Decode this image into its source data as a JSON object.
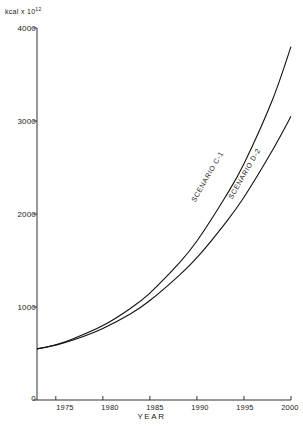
{
  "chart_data": {
    "type": "line",
    "title": "",
    "xlabel": "YEAR",
    "ylabel": "kcal x 10",
    "ylabel_exponent": "12",
    "xlim": [
      1973,
      2000
    ],
    "ylim": [
      0,
      4000
    ],
    "grid": false,
    "legend_position": "inline-curve-labels",
    "xticks": [
      1975,
      1980,
      1985,
      1990,
      1995,
      2000
    ],
    "xtick_labels": [
      "1975",
      "1980",
      "1985",
      "1990",
      "1995",
      "2000"
    ],
    "yticks": [
      0,
      1000,
      2000,
      3000,
      4000
    ],
    "ytick_labels": [
      "0",
      "1000",
      "2000",
      "3000",
      "4000"
    ],
    "x": [
      1973,
      1975,
      1977,
      1980,
      1983,
      1985,
      1988,
      1990,
      1993,
      1995,
      1998,
      2000
    ],
    "series": [
      {
        "name": "SCENARIO C-1",
        "label": "SCENARIO C-1",
        "values": [
          550,
          590,
          650,
          770,
          930,
          1070,
          1330,
          1530,
          1900,
          2180,
          2680,
          3050
        ]
      },
      {
        "name": "SCENARIO D-2",
        "label": "SCENARIO D-2",
        "values": [
          550,
          595,
          665,
          800,
          990,
          1150,
          1460,
          1710,
          2180,
          2540,
          3220,
          3800
        ]
      }
    ]
  },
  "axes": {
    "y_unit_prefix": "kcal x 10",
    "y_unit_exponent": "12",
    "x_axis_title": "YEAR"
  },
  "colors": {
    "ink": "#1a1a1a",
    "axis": "#333333",
    "curve": "#111111",
    "background": "#ffffff"
  }
}
